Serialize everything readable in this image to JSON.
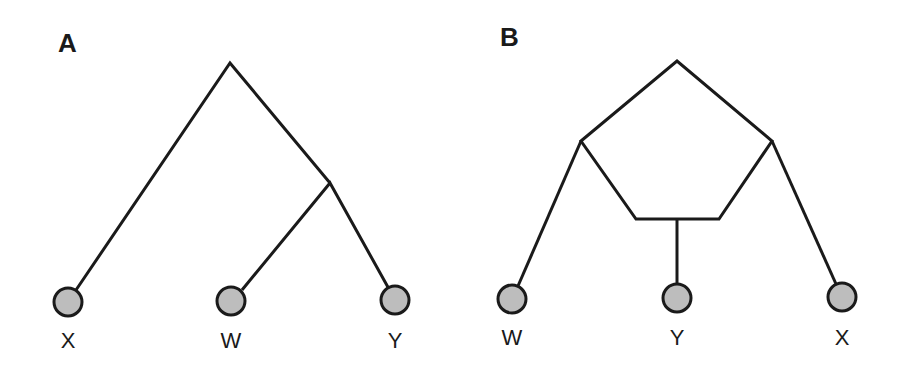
{
  "panels": [
    {
      "label": "A",
      "type": "phylogenetic-tree",
      "leaves": [
        "X",
        "W",
        "Y"
      ],
      "topology": "(X,(W,Y))"
    },
    {
      "label": "B",
      "type": "phylogenetic-network",
      "leaves": [
        "W",
        "Y",
        "X"
      ],
      "topology": "reticulate network with pentagon cycle; Y arises from hybrid node below W and X lineages"
    }
  ],
  "colors": {
    "line": "#1a1a1a",
    "leaf_fill": "#bdbdbd",
    "background": "#ffffff"
  }
}
